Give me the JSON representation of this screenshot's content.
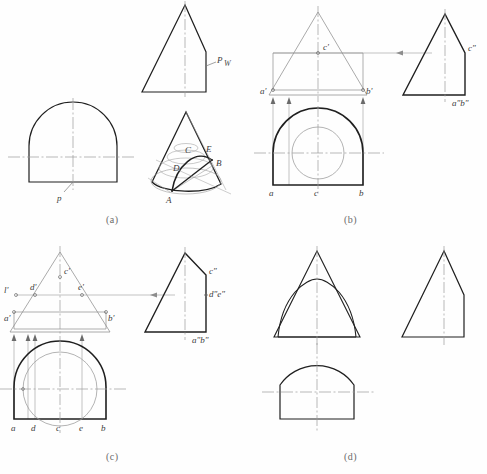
{
  "figure": {
    "panels": [
      {
        "id": "a",
        "caption": "(a)",
        "labels": {
          "plane_trace_w": "P",
          "plane_trace_w_sub": "W",
          "plane_trace_h": "p",
          "point_a": "A",
          "point_b": "B",
          "point_c": "C",
          "point_d": "D",
          "point_e": "E"
        }
      },
      {
        "id": "b",
        "caption": "(b)",
        "labels": {
          "front_c": "c'",
          "front_a": "a'",
          "front_b": "b'",
          "top_a": "a",
          "top_b": "b",
          "top_c": "c",
          "side_c": "c\"",
          "side_ab": "a\"b\""
        }
      },
      {
        "id": "c",
        "caption": "(c)",
        "labels": {
          "front_c": "c'",
          "front_l": "l'",
          "front_d": "d'",
          "front_e": "e'",
          "front_a": "a'",
          "front_b": "b'",
          "top_a": "a",
          "top_d": "d",
          "top_c": "c",
          "top_e": "e",
          "top_b": "b",
          "side_c": "c\"",
          "side_de": "d\"e\"",
          "side_ab": "a\"b\""
        }
      },
      {
        "id": "d",
        "caption": "(d)",
        "labels": {}
      }
    ],
    "colors": {
      "outline": "#1f1f1f",
      "construction": "#8d8d8d",
      "centerline": "#9b9b9b",
      "label": "#3b3b3b",
      "caption": "#6a6a6a",
      "background": "#fefefe"
    }
  }
}
